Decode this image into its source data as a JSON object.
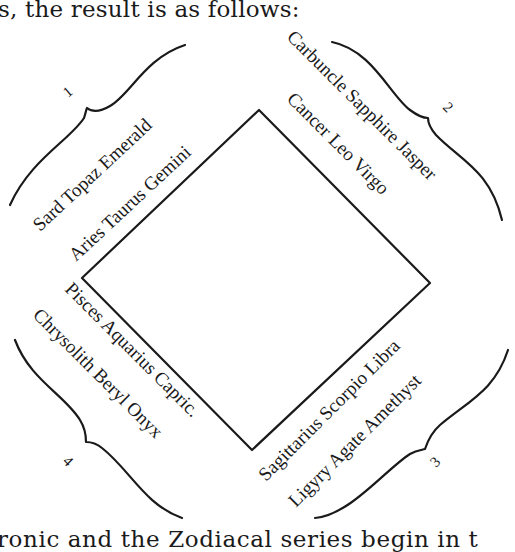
{
  "text": {
    "top_line": "s, the result is as follows:",
    "bottom_line": "ronic and the Zodiacal series begin in t"
  },
  "diagram": {
    "shape": "square rotated 45°",
    "colors": {
      "ink": "#1a1a1a",
      "background": "#ffffff"
    },
    "groups": [
      {
        "number": "1",
        "position": "upper-left",
        "stones": "Sard Topaz Emerald",
        "signs": "Aries Taurus Gemini"
      },
      {
        "number": "2",
        "position": "upper-right",
        "stones": "Carbuncle Sapphire Jasper",
        "signs": "Cancer Leo Virgo"
      },
      {
        "number": "3",
        "position": "lower-right",
        "stones": "Ligyry Agate Amethyst",
        "signs": "Sagittarius Scorpio Libra"
      },
      {
        "number": "4",
        "position": "lower-left",
        "stones": "Chrysolith Beryl Onyx",
        "signs": "Pisces Aquarius Capric."
      }
    ]
  }
}
